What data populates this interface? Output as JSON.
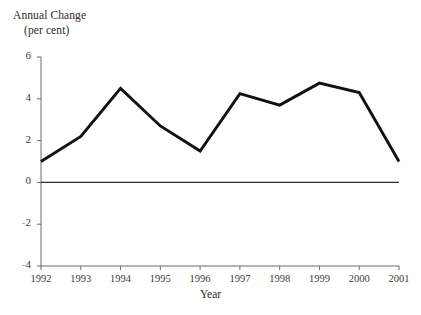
{
  "chart_data": {
    "type": "line",
    "title": "Annual Change (per cent)",
    "title_line1": "Annual Change",
    "title_line2": "(per cent)",
    "xlabel": "Year",
    "ylabel": "Annual Change (per cent)",
    "categories": [
      "1992",
      "1993",
      "1994",
      "1995",
      "1996",
      "1997",
      "1998",
      "1999",
      "2000",
      "2001"
    ],
    "values": [
      1.0,
      2.2,
      4.5,
      2.7,
      1.5,
      4.25,
      3.7,
      4.75,
      4.3,
      1.0
    ],
    "x": [
      1992,
      1993,
      1994,
      1995,
      1996,
      1997,
      1998,
      1999,
      2000,
      2001
    ],
    "ylim": [
      -4,
      6
    ],
    "xlim": [
      1992,
      2001
    ],
    "yticks": [
      6,
      4,
      2,
      0,
      -2,
      -4
    ],
    "ytick_labels": [
      "6",
      "4",
      "2",
      "0",
      "-2",
      "-4"
    ],
    "grid": false,
    "legend": null,
    "zero_line": 0,
    "series_color": "#111111",
    "axis_color": "#555555"
  }
}
